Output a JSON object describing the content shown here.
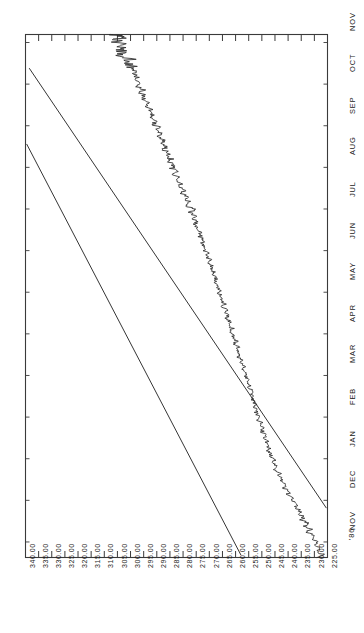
{
  "window": {
    "title": "Price Chart"
  },
  "axes": {
    "value_axis": {
      "name": "value-axis",
      "orientation": "horizontal-rotated-labels",
      "labels": [
        "340.00",
        "335.00",
        "330.00",
        "325.00",
        "320.00",
        "315.00",
        "310.00",
        "305.00",
        "300.00",
        "295.00",
        "290.00",
        "285.00",
        "280.00",
        "275.00",
        "270.00",
        "265.00",
        "260.00",
        "255.00",
        "250.00",
        "245.00",
        "240.00",
        "235.00",
        "230.00",
        "225.00"
      ]
    },
    "time_axis": {
      "name": "time-axis",
      "orientation": "vertical",
      "labels": [
        "NOV",
        "OCT",
        "SEP",
        "AUG",
        "JUL",
        "JUN",
        "MAY",
        "APR",
        "MAR",
        "FEB",
        "JAN",
        "DEC",
        "NOV"
      ],
      "year_label": "'86"
    }
  },
  "colors": {
    "frame": "#3a3a3a",
    "series": "#2a2a2a",
    "trendline": "#2a2a2a",
    "background": "#ffffff",
    "text": "#1a1a1a",
    "top_rule": "#c8c8c8"
  },
  "chart_data": {
    "type": "line",
    "title": "",
    "subtitle": "",
    "xlabel": "",
    "ylabel": "",
    "orientation": "rotated-90",
    "grid": false,
    "legend": null,
    "value_axis_labels": [
      "340.00",
      "335.00",
      "330.00",
      "325.00",
      "320.00",
      "315.00",
      "310.00",
      "305.00",
      "300.00",
      "295.00",
      "290.00",
      "285.00",
      "280.00",
      "275.00",
      "270.00",
      "265.00",
      "260.00",
      "255.00",
      "250.00",
      "245.00",
      "240.00",
      "235.00",
      "230.00",
      "225.00"
    ],
    "value_range": [
      225.0,
      340.0
    ],
    "value_tick_step": 5.0,
    "time_axis_labels": [
      "NOV",
      "OCT",
      "SEP",
      "AUG",
      "JUL",
      "JUN",
      "MAY",
      "APR",
      "MAR",
      "FEB",
      "JAN",
      "DEC",
      "NOV"
    ],
    "year_marker": "'86",
    "series": [
      {
        "name": "price",
        "role": "data",
        "points": [
          [
            0.0,
            228.2
          ],
          [
            0.6,
            227.0
          ],
          [
            1.2,
            229.1
          ],
          [
            1.8,
            228.0
          ],
          [
            2.4,
            230.4
          ],
          [
            3.0,
            229.0
          ],
          [
            3.6,
            231.2
          ],
          [
            4.2,
            230.0
          ],
          [
            4.8,
            232.6
          ],
          [
            5.4,
            231.5
          ],
          [
            6.0,
            233.8
          ],
          [
            6.6,
            232.4
          ],
          [
            7.2,
            234.9
          ],
          [
            7.8,
            234.0
          ],
          [
            8.4,
            236.2
          ],
          [
            9.0,
            235.1
          ],
          [
            9.6,
            237.4
          ],
          [
            10.2,
            236.4
          ],
          [
            10.8,
            238.8
          ],
          [
            11.4,
            238.0
          ],
          [
            12.0,
            240.3
          ],
          [
            12.6,
            239.2
          ],
          [
            13.2,
            241.5
          ],
          [
            13.8,
            240.8
          ],
          [
            14.4,
            242.9
          ],
          [
            15.0,
            242.0
          ],
          [
            15.6,
            243.9
          ],
          [
            16.2,
            243.2
          ],
          [
            16.8,
            245.0
          ],
          [
            17.4,
            244.4
          ],
          [
            18.0,
            246.1
          ],
          [
            18.6,
            245.2
          ],
          [
            19.2,
            246.9
          ],
          [
            19.8,
            246.3
          ],
          [
            20.4,
            247.6
          ],
          [
            21.0,
            247.0
          ],
          [
            21.6,
            248.4
          ],
          [
            22.2,
            247.9
          ],
          [
            22.8,
            249.2
          ],
          [
            23.4,
            248.6
          ],
          [
            24.0,
            250.1
          ],
          [
            24.6,
            249.4
          ],
          [
            25.2,
            250.8
          ],
          [
            25.8,
            250.2
          ],
          [
            26.4,
            251.6
          ],
          [
            27.0,
            251.0
          ],
          [
            27.6,
            252.2
          ],
          [
            28.2,
            251.7
          ],
          [
            28.8,
            253.0
          ],
          [
            29.4,
            252.5
          ],
          [
            30.0,
            253.6
          ],
          [
            30.6,
            253.0
          ],
          [
            31.2,
            254.2
          ],
          [
            31.8,
            253.7
          ],
          [
            32.4,
            255.0
          ],
          [
            33.0,
            254.4
          ],
          [
            33.6,
            255.9
          ],
          [
            34.2,
            255.2
          ],
          [
            34.8,
            256.6
          ],
          [
            35.4,
            256.0
          ],
          [
            36.0,
            257.4
          ],
          [
            36.6,
            256.8
          ],
          [
            37.2,
            258.3
          ],
          [
            37.8,
            257.6
          ],
          [
            38.4,
            259.0
          ],
          [
            39.0,
            258.4
          ],
          [
            39.6,
            259.8
          ],
          [
            40.2,
            259.1
          ],
          [
            40.8,
            260.4
          ],
          [
            41.4,
            259.8
          ],
          [
            42.0,
            261.0
          ],
          [
            42.6,
            260.4
          ],
          [
            43.2,
            261.8
          ],
          [
            43.8,
            261.2
          ],
          [
            44.4,
            262.6
          ],
          [
            45.0,
            262.0
          ],
          [
            45.6,
            263.4
          ],
          [
            46.2,
            262.8
          ],
          [
            46.8,
            264.0
          ],
          [
            47.4,
            263.5
          ],
          [
            48.0,
            264.8
          ],
          [
            48.6,
            264.2
          ],
          [
            49.2,
            265.6
          ],
          [
            49.8,
            265.0
          ],
          [
            50.4,
            266.4
          ],
          [
            51.0,
            265.8
          ],
          [
            51.6,
            267.2
          ],
          [
            52.2,
            266.6
          ],
          [
            52.8,
            268.0
          ],
          [
            53.4,
            267.4
          ],
          [
            54.0,
            268.8
          ],
          [
            54.6,
            268.1
          ],
          [
            55.2,
            269.6
          ],
          [
            55.8,
            269.0
          ],
          [
            56.4,
            270.4
          ],
          [
            57.0,
            269.8
          ],
          [
            57.6,
            271.2
          ],
          [
            58.2,
            270.6
          ],
          [
            58.8,
            272.0
          ],
          [
            59.4,
            271.4
          ],
          [
            60.0,
            272.8
          ],
          [
            60.6,
            272.2
          ],
          [
            61.2,
            273.6
          ],
          [
            61.8,
            273.0
          ],
          [
            62.4,
            274.4
          ],
          [
            63.0,
            273.8
          ],
          [
            63.6,
            275.2
          ],
          [
            64.2,
            274.6
          ],
          [
            64.8,
            276.0
          ],
          [
            65.4,
            275.4
          ],
          [
            66.0,
            277.0
          ],
          [
            66.6,
            276.2
          ],
          [
            67.2,
            278.0
          ],
          [
            67.8,
            277.2
          ],
          [
            68.4,
            279.0
          ],
          [
            69.0,
            278.2
          ],
          [
            69.6,
            280.2
          ],
          [
            70.2,
            279.4
          ],
          [
            70.8,
            281.4
          ],
          [
            71.4,
            280.5
          ],
          [
            72.0,
            282.4
          ],
          [
            72.6,
            281.6
          ],
          [
            73.2,
            283.4
          ],
          [
            73.8,
            282.6
          ],
          [
            74.4,
            284.4
          ],
          [
            75.0,
            283.6
          ],
          [
            75.6,
            285.4
          ],
          [
            76.2,
            284.6
          ],
          [
            76.8,
            286.4
          ],
          [
            77.4,
            285.6
          ],
          [
            78.0,
            287.2
          ],
          [
            78.6,
            286.4
          ],
          [
            79.2,
            288.2
          ],
          [
            79.8,
            287.4
          ],
          [
            80.4,
            289.0
          ],
          [
            81.0,
            288.2
          ],
          [
            81.6,
            290.0
          ],
          [
            82.2,
            289.2
          ],
          [
            82.8,
            291.0
          ],
          [
            83.4,
            290.2
          ],
          [
            84.0,
            292.0
          ],
          [
            84.6,
            291.2
          ],
          [
            85.2,
            293.0
          ],
          [
            85.8,
            292.2
          ],
          [
            86.4,
            294.0
          ],
          [
            87.0,
            293.2
          ],
          [
            87.6,
            295.0
          ],
          [
            88.2,
            294.2
          ],
          [
            88.8,
            296.0
          ],
          [
            89.4,
            295.2
          ],
          [
            90.0,
            297.0
          ],
          [
            90.6,
            296.2
          ],
          [
            91.2,
            298.0
          ],
          [
            91.8,
            297.2
          ],
          [
            92.4,
            299.0
          ],
          [
            93.0,
            298.2
          ],
          [
            93.6,
            300.0
          ],
          [
            94.2,
            299.2
          ],
          [
            94.8,
            301.2
          ],
          [
            95.4,
            300.4
          ],
          [
            96.0,
            302.4
          ],
          [
            96.6,
            301.6
          ],
          [
            97.2,
            303.4
          ],
          [
            97.8,
            302.6
          ],
          [
            98.4,
            304.4
          ],
          [
            99.0,
            303.8
          ],
          [
            99.6,
            305.4
          ],
          [
            100.0,
            304.8
          ]
        ]
      },
      {
        "name": "upper-trendline",
        "role": "trendline",
        "points": [
          [
            9.5,
            225.5
          ],
          [
            93.5,
            338.5
          ]
        ]
      },
      {
        "name": "lower-trendline",
        "role": "trendline",
        "points": [
          [
            0.5,
            258.0
          ],
          [
            79.0,
            339.5
          ]
        ]
      }
    ]
  }
}
